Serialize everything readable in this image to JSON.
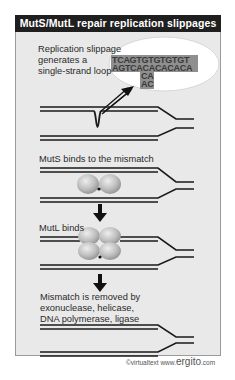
{
  "title": "MutS/MutL repair replication slippages",
  "steps": [
    {
      "id": "slippage",
      "lines": [
        "Replication slippage",
        "generates a",
        "single-strand loop"
      ]
    },
    {
      "id": "muts",
      "lines": [
        "MutS binds to the mismatch"
      ]
    },
    {
      "id": "mutl",
      "lines": [
        "MutL binds"
      ]
    },
    {
      "id": "removal",
      "lines": [
        "Mismatch is removed by",
        "exonuclease, helicase,",
        "DNA polymerase, ligase"
      ]
    }
  ],
  "bubble": {
    "top_strand": "TCAGTGTGTGTGT",
    "bottom_strand": "AGTCACACACACA",
    "loop_1": "CA",
    "loop_2": "AC"
  },
  "copyright": {
    "prefix": "©virtualtext",
    "site_prefix": "www.",
    "site_brand": "ergito",
    "site_suffix": ".com"
  },
  "colors": {
    "title_bar": "#1f1f1f",
    "panel": "#e9e9e9",
    "dna": "#1a1a1a",
    "protein": "#b5b5b5",
    "bubble_highlight": "#8f8f8f"
  }
}
